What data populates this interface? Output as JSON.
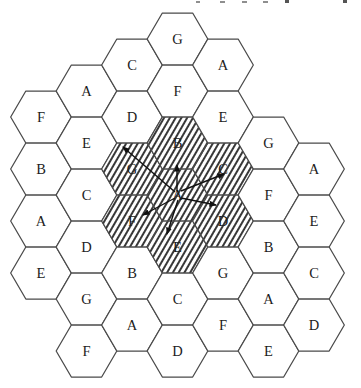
{
  "diagram": {
    "colors": {
      "background": "#ffffff",
      "cell_fill": "#ffffff",
      "cell_stroke": "#4a4a4a",
      "hatch_line": "#151515",
      "label_text": "#1c1c1c",
      "arrow": "#111111",
      "fragment_light": "#8f8f8f",
      "fragment_dark": "#555555"
    },
    "geometry": {
      "canvas_width": 361,
      "canvas_height": 388,
      "hex_radius": 30.33,
      "hex_half_height": 26,
      "stroke_width": 1.25,
      "hatch_spacing": 5,
      "hatch_angle_deg": 30,
      "hatch_line_width": 1.7,
      "label_font_size": 14.5
    },
    "cells": [
      {
        "x": 41,
        "y": 117,
        "label": "F",
        "hatched": false
      },
      {
        "x": 41,
        "y": 169,
        "label": "B",
        "hatched": false
      },
      {
        "x": 41,
        "y": 221,
        "label": "A",
        "hatched": false
      },
      {
        "x": 41,
        "y": 273,
        "label": "E",
        "hatched": false
      },
      {
        "x": 86.5,
        "y": 91,
        "label": "A",
        "hatched": false
      },
      {
        "x": 86.5,
        "y": 143,
        "label": "E",
        "hatched": false
      },
      {
        "x": 86.5,
        "y": 195,
        "label": "C",
        "hatched": false
      },
      {
        "x": 86.5,
        "y": 247,
        "label": "D",
        "hatched": false
      },
      {
        "x": 86.5,
        "y": 299,
        "label": "G",
        "hatched": false
      },
      {
        "x": 86.5,
        "y": 351,
        "label": "F",
        "hatched": false
      },
      {
        "x": 132,
        "y": 65,
        "label": "C",
        "hatched": false
      },
      {
        "x": 132,
        "y": 117,
        "label": "D",
        "hatched": false
      },
      {
        "x": 132,
        "y": 169,
        "label": "G",
        "hatched": true
      },
      {
        "x": 132,
        "y": 221,
        "label": "F",
        "hatched": true
      },
      {
        "x": 132,
        "y": 273,
        "label": "B",
        "hatched": false
      },
      {
        "x": 132,
        "y": 325,
        "label": "A",
        "hatched": false
      },
      {
        "x": 177.5,
        "y": 39,
        "label": "G",
        "hatched": false
      },
      {
        "x": 177.5,
        "y": 91,
        "label": "F",
        "hatched": false
      },
      {
        "x": 177.5,
        "y": 143,
        "label": "B",
        "hatched": true
      },
      {
        "x": 177.5,
        "y": 195,
        "label": "A",
        "hatched": true
      },
      {
        "x": 177.5,
        "y": 247,
        "label": "E",
        "hatched": true
      },
      {
        "x": 177.5,
        "y": 299,
        "label": "C",
        "hatched": false
      },
      {
        "x": 177.5,
        "y": 351,
        "label": "D",
        "hatched": false
      },
      {
        "x": 223,
        "y": 65,
        "label": "A",
        "hatched": false
      },
      {
        "x": 223,
        "y": 117,
        "label": "E",
        "hatched": false
      },
      {
        "x": 223,
        "y": 169,
        "label": "C",
        "hatched": true
      },
      {
        "x": 223,
        "y": 221,
        "label": "D",
        "hatched": true
      },
      {
        "x": 223,
        "y": 273,
        "label": "G",
        "hatched": false
      },
      {
        "x": 223,
        "y": 325,
        "label": "F",
        "hatched": false
      },
      {
        "x": 268.5,
        "y": 143,
        "label": "G",
        "hatched": false
      },
      {
        "x": 268.5,
        "y": 195,
        "label": "F",
        "hatched": false
      },
      {
        "x": 268.5,
        "y": 247,
        "label": "B",
        "hatched": false
      },
      {
        "x": 268.5,
        "y": 299,
        "label": "A",
        "hatched": false
      },
      {
        "x": 268.5,
        "y": 351,
        "label": "E",
        "hatched": false
      },
      {
        "x": 314,
        "y": 169,
        "label": "A",
        "hatched": false
      },
      {
        "x": 314,
        "y": 221,
        "label": "E",
        "hatched": false
      },
      {
        "x": 314,
        "y": 273,
        "label": "C",
        "hatched": false
      },
      {
        "x": 314,
        "y": 325,
        "label": "D",
        "hatched": false
      }
    ],
    "arrows": [
      {
        "x1": 175,
        "y1": 192,
        "x2": 123,
        "y2": 147,
        "to": "G"
      },
      {
        "x1": 177,
        "y1": 191,
        "x2": 177,
        "y2": 165,
        "to": "B"
      },
      {
        "x1": 181,
        "y1": 191,
        "x2": 224,
        "y2": 174,
        "to": "C"
      },
      {
        "x1": 181,
        "y1": 198,
        "x2": 216,
        "y2": 205,
        "to": "D"
      },
      {
        "x1": 178,
        "y1": 200,
        "x2": 167,
        "y2": 234,
        "to": "E"
      },
      {
        "x1": 175,
        "y1": 198,
        "x2": 143,
        "y2": 215,
        "to": "F"
      }
    ],
    "cropped_text_fragments": [
      {
        "x": 196,
        "y": 1,
        "w": 4,
        "h": 2,
        "tone": "light"
      },
      {
        "x": 220,
        "y": 1,
        "w": 5,
        "h": 2,
        "tone": "light"
      },
      {
        "x": 242,
        "y": 1,
        "w": 5,
        "h": 2,
        "tone": "light"
      },
      {
        "x": 263,
        "y": 1,
        "w": 5,
        "h": 2,
        "tone": "light"
      },
      {
        "x": 285,
        "y": 0,
        "w": 4,
        "h": 3,
        "tone": "dark"
      },
      {
        "x": 343,
        "y": 0,
        "w": 4,
        "h": 3,
        "tone": "dark"
      }
    ]
  }
}
